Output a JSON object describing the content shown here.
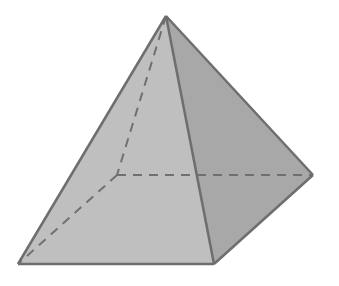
{
  "diagram": {
    "type": "square-pyramid",
    "colors": {
      "background": "#ffffff",
      "front_face": "#bfbfbf",
      "right_face": "#a8a8a8",
      "edge": "#6e6e6e",
      "hidden_edge": "#707070"
    },
    "vertices": {
      "apex": [
        166,
        16
      ],
      "front_left": [
        18,
        264
      ],
      "front_right": [
        214,
        264
      ],
      "back_right": [
        313,
        175
      ],
      "back_left_hidden": [
        117,
        175
      ]
    }
  }
}
